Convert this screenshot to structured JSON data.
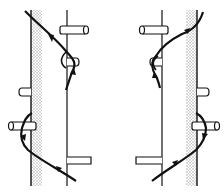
{
  "diagram": {
    "type": "technical-line-drawing",
    "panels": [
      {
        "id": "left",
        "description": "Line wrapping around pegs on left post, routed between stippled rail and thin rod",
        "elements": [
          "stippled-rail",
          "thin-rod",
          "upper-peg",
          "small-peg",
          "lower-peg",
          "right-bracket",
          "rope-path",
          "direction-arrows"
        ]
      },
      {
        "id": "right",
        "description": "Mirror image: line wrapping around pegs on right post",
        "elements": [
          "stippled-rail",
          "thin-rod",
          "upper-peg",
          "small-peg",
          "lower-peg",
          "left-bracket",
          "rope-path",
          "direction-arrows"
        ]
      }
    ],
    "colors": {
      "line": "#111111",
      "stipple": "#bdbdbd",
      "background": "#ffffff"
    }
  }
}
